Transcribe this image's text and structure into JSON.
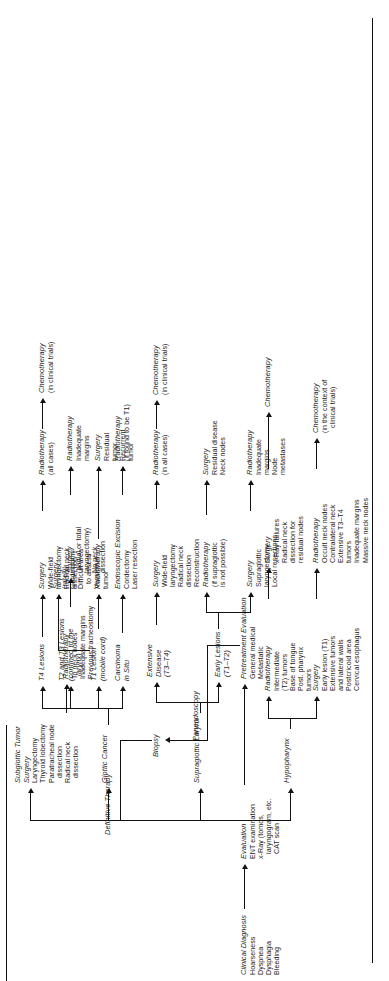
{
  "figure": {
    "orientation": "rotated-90",
    "type": "clinical-management-flowchart",
    "topic": "Laryngeal and hypopharyngeal cancer management algorithm"
  },
  "spine": {
    "clinical_diagnosis": {
      "title": "Clinical Diagnosis",
      "items": [
        "Hoarseness",
        "Dyspnea",
        "Dysphagia",
        "Bleeding"
      ]
    },
    "evaluation": {
      "title": "Evaluation",
      "items": [
        "ENT examination",
        "x-Ray (tomos,",
        "laryngogram, etc.",
        "CAT scan"
      ]
    },
    "pretreatment_evaluation": {
      "title": "Pretreatment Evaluation",
      "items": [
        "General medical",
        "Metastatic"
      ]
    },
    "panendoscopy": {
      "title": "Panendoscopy"
    },
    "biopsy": {
      "title": "Biopsy"
    },
    "definitive_therapy": {
      "title": "Definitive Therapy"
    }
  },
  "branches": {
    "hypopharynx": {
      "title": "Hypopharynx",
      "surgery": {
        "title": "Surgery",
        "items": [
          "Early lesion (T1)",
          "Extensive tumors",
          "and lateral walls",
          "Postcricoid area",
          "Cervical esophagus"
        ]
      },
      "radiotherapy_1": {
        "title": "Radiotherapy",
        "items": [
          "Intermediate",
          "(T2) tumors",
          "Base of tongue",
          "Post. pharynx",
          "tumors"
        ]
      },
      "radiotherapy_2": {
        "title": "Radiotherapy",
        "items": [
          "Occult neck nodes",
          "Contralateral neck",
          "Extensive T3–T4",
          "tumors",
          "Inadequate margins",
          "Massive neck nodes"
        ]
      },
      "surgery_2": {
        "title": "Surgery",
        "items": [
          "x-Ray failures",
          "Radical neck",
          "dissection for",
          "residual nodes"
        ]
      },
      "chemotherapy_1": {
        "title": "Chemotherapy",
        "items": [
          "(in the context of",
          "clinical trials)"
        ]
      },
      "chemotherapy_2": {
        "title": "Chemotherapy",
        "items": []
      }
    },
    "supraglottic_larynx": {
      "title": "Supraglottic Larynx",
      "early_lesions": {
        "title": "Early Lesions",
        "sub": "(T1–T2)"
      },
      "extensive_disease": {
        "title": "Extensive",
        "title2": "Disease",
        "sub": "(T3–T4)"
      },
      "early_surgery": {
        "title": "Surgery",
        "items": [
          "Supraglottic",
          "laryngectomy",
          "Local resections"
        ]
      },
      "early_radiotherapy": {
        "title": "Radiotherapy",
        "items": [
          "(if supraglottic",
          "is not possible)"
        ]
      },
      "early_radiotherapy_post": {
        "title": "Radiotherapy",
        "items": [
          "Inadequate",
          "margins",
          "Node",
          "metastases"
        ]
      },
      "early_surgery_post": {
        "title": "Surgery",
        "items": [
          "Residual disease",
          "Neck nodes"
        ]
      },
      "ext_surgery": {
        "title": "Surgery",
        "items": [
          "Wide-field",
          "laryngectomy",
          "Radical neck",
          "dissection",
          "Reconstruction"
        ]
      },
      "ext_radiotherapy": {
        "title": "Radiotherapy",
        "items": [
          "(in all cases)"
        ]
      },
      "ext_chemotherapy": {
        "title": "Chemotherapy",
        "items": [
          "(in clinical trials)"
        ]
      }
    },
    "glottic_cancer": {
      "title": "Glottic Cancer",
      "carcinoma_in_situ": {
        "title": "Carcinoma",
        "title2": "in Situ"
      },
      "cis_excision": {
        "title": "Endoscopic Excision",
        "items": [
          "Cordectomy",
          "Laser resection"
        ]
      },
      "cis_radiotherapy": {
        "title": "Radiotherapy",
        "items": [
          "(if found to be T1)"
        ]
      },
      "t1_lesion": {
        "title": "T1 Lesion",
        "sub": "(mobile cord)"
      },
      "t1_radiotherapy": {
        "title": "Radiotherapy",
        "items": []
      },
      "t1_surgery": {
        "title": "Surgery",
        "items": [
          "Residual",
          "tumor",
          "Recurrent",
          "tumor"
        ]
      },
      "t1_surgery_rarely": {
        "title": "Surgery",
        "items": [
          "(rarely)",
          "Cordectomy",
          "Difficult area",
          "to assess",
          "Verrucous",
          "tumor"
        ]
      },
      "t2_t3_lesions": {
        "title": "T2 and T3 Lesions",
        "sub": "(confined to the",
        "sub2": "larynx)"
      },
      "t2t3_surgery": {
        "title": "Surgery",
        "items": [
          "(partial or total",
          "laryngectomy)",
          "No neck",
          "dissection"
        ]
      },
      "t2t3_radiotherapy": {
        "title": "Radiotherapy",
        "items": [
          "Inadequate",
          "margins"
        ]
      },
      "t4_lesions": {
        "title": "T4 Lesions"
      },
      "t4_surgery": {
        "title": "Surgery",
        "items": [
          "Wide-field",
          "laryngectomy",
          "Radical neck",
          "dissection"
        ]
      },
      "t4_radiotherapy": {
        "title": "Radiotherapy",
        "items": [
          "(all cases)"
        ]
      },
      "t4_chemotherapy": {
        "title": "Chemotherapy",
        "items": [
          "(in clinical trials)"
        ]
      }
    },
    "subglottic_tumor": {
      "title": "Subglottic Tumor",
      "surgery": {
        "title": "Surgery",
        "items": [
          "Laryngectomy",
          "Thyroid lobectomy",
          "Paratracheal node",
          "dissection",
          "Radical neck",
          "dissection"
        ]
      },
      "radiotherapy": {
        "title": "Radiotherapy",
        "items": [
          "To neck nodes",
          "Inadequate margins",
          "Previous tracheostomy"
        ]
      }
    }
  }
}
